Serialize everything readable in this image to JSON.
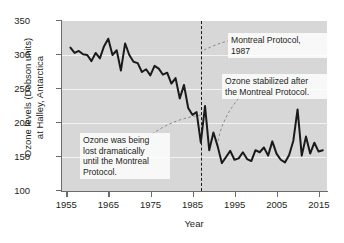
{
  "chart_data": {
    "type": "line",
    "title": "",
    "xlabel": "Year",
    "ylabel": "Ozone levels (Dobson units)\nat Halley, Antarctica",
    "ylabel_line1": "Ozone levels (Dobson units)",
    "ylabel_line2": "at Halley, Antarctica",
    "xlim": [
      1954,
      2017
    ],
    "ylim": [
      100,
      350
    ],
    "xticks": [
      1955,
      1965,
      1975,
      1985,
      1995,
      2005,
      2015
    ],
    "xtick_labels": [
      "1955",
      "1965",
      "1975",
      "1985",
      "1995",
      "2005",
      "2015"
    ],
    "yticks": [
      100,
      150,
      200,
      250,
      300,
      350
    ],
    "ytick_labels": [
      "100",
      "150",
      "200",
      "250",
      "300",
      "350"
    ],
    "grid": "horizontal",
    "legend": "none",
    "line_color": "#1a1a1a",
    "plot_background": "#d7d7d7",
    "gridline_color": "#f2f2f2",
    "series": [
      {
        "name": "Ozone levels at Halley, Antarctica",
        "x": [
          1956,
          1957,
          1958,
          1959,
          1960,
          1961,
          1962,
          1963,
          1964,
          1965,
          1966,
          1967,
          1968,
          1969,
          1970,
          1971,
          1972,
          1973,
          1974,
          1975,
          1976,
          1977,
          1978,
          1979,
          1980,
          1981,
          1982,
          1983,
          1984,
          1985,
          1986,
          1987,
          1988,
          1989,
          1990,
          1991,
          1992,
          1993,
          1994,
          1995,
          1996,
          1997,
          1998,
          1999,
          2000,
          2001,
          2002,
          2003,
          2004,
          2005,
          2006,
          2007,
          2008,
          2009,
          2010,
          2011,
          2012,
          2013,
          2014,
          2015,
          2016
        ],
        "values": [
          311,
          303,
          306,
          301,
          300,
          291,
          303,
          295,
          313,
          324,
          300,
          307,
          277,
          317,
          300,
          290,
          288,
          275,
          279,
          270,
          284,
          280,
          271,
          274,
          258,
          266,
          236,
          256,
          222,
          212,
          216,
          171,
          225,
          160,
          186,
          166,
          141,
          150,
          159,
          146,
          148,
          157,
          147,
          144,
          160,
          157,
          164,
          152,
          173,
          155,
          146,
          142,
          153,
          174,
          220,
          152,
          180,
          155,
          171,
          158,
          160
        ],
        "marker": "none",
        "line_width": 2
      }
    ],
    "vertical_markers": [
      {
        "label": "Montreal Protocol, 1987",
        "x": 1987,
        "style": "dashed"
      }
    ],
    "annotations": [
      {
        "id": "lost",
        "text": "Ozone was being\nlost dramatically\nuntil the Montreal\nProtocol.",
        "points_to": "declining-trend-1970s-1980s"
      },
      {
        "id": "protocol",
        "text": "Montreal Protocol,\n1987",
        "points_to": "vertical-dashed-line-1987"
      },
      {
        "id": "stable",
        "text": "Ozone stabilized after\nthe Montreal Protocol.",
        "points_to": "flat-trend-post-1995"
      }
    ]
  }
}
